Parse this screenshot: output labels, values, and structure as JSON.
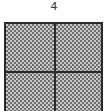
{
  "figure": {
    "label": "4",
    "grid": {
      "rows": 2,
      "cols": 2,
      "fill_pattern": "checkered-stipple",
      "colors": {
        "border": "#2a2a2a",
        "fill_dark": "#6f6f6f",
        "fill_light": "#c8c8c8"
      }
    }
  }
}
